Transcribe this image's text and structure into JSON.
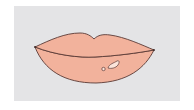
{
  "illustration": {
    "subject": "lips",
    "colors": {
      "background": "#ffffff",
      "panel": "#e4e4e6",
      "lip_fill": "#f2b29c",
      "outline": "#5a3a36",
      "highlight": "#fbe4da"
    }
  }
}
